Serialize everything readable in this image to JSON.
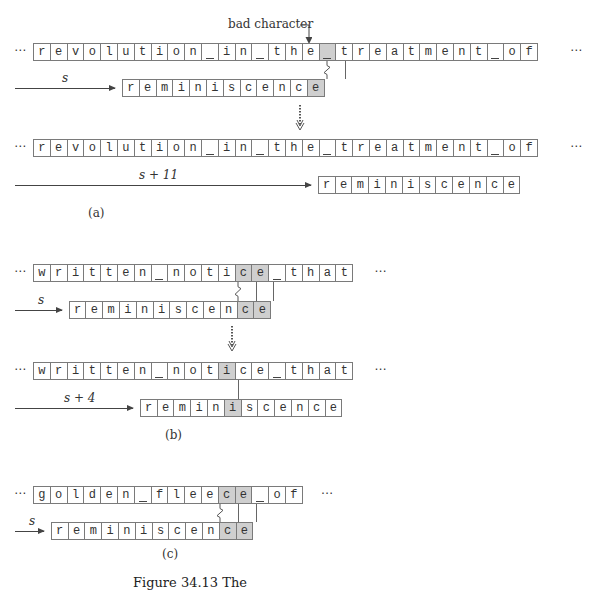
{
  "figure": {
    "bad_character_label": "bad character",
    "ellipsis": "⋯",
    "highlight_color": "#cfcfcf",
    "caption_fragment": "Figure 34.13  The"
  },
  "panels": [
    {
      "label": "(a)",
      "before": {
        "text": "revolution_in_the_treatment_of",
        "text_highlight": [
          17
        ],
        "pattern": "reminiscence",
        "pattern_offset": 5,
        "pattern_highlight": [
          11
        ],
        "shift_label": "s"
      },
      "after": {
        "text": "revolution_in_the_treatment_of",
        "text_highlight": [],
        "pattern": "reminiscence",
        "pattern_offset": 16,
        "pattern_highlight": [],
        "shift_label": "s + 11"
      }
    },
    {
      "label": "(b)",
      "before": {
        "text": "written_notice_that",
        "text_highlight": [
          12,
          13
        ],
        "pattern": "reminiscence",
        "pattern_offset": 2,
        "pattern_highlight": [
          10,
          11
        ],
        "shift_label": "s"
      },
      "after": {
        "text": "written_notice_that",
        "text_highlight": [
          11
        ],
        "pattern": "reminiscence",
        "pattern_offset": 6,
        "pattern_highlight": [
          5
        ],
        "shift_label": "s + 4"
      }
    },
    {
      "label": "(c)",
      "before": {
        "text": "golden_fleece_of",
        "text_highlight": [
          11,
          12
        ],
        "pattern": "reminiscence",
        "pattern_offset": 1,
        "pattern_highlight": [
          10,
          11
        ],
        "shift_label": "s"
      }
    }
  ]
}
